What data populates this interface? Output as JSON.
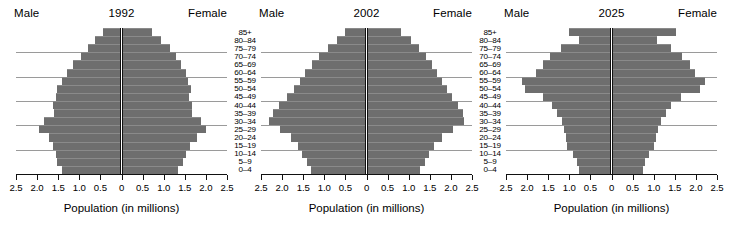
{
  "chart_data": {
    "type": "bar",
    "chart_kind": "population-pyramid",
    "title": "",
    "xlabel": "Population (in millions)",
    "ylabel": "",
    "xlim": [
      -2.5,
      2.5
    ],
    "xticks": [
      2.5,
      2.0,
      1.5,
      1.0,
      0.5,
      0,
      0.5,
      1.0,
      1.5,
      2.0,
      2.5
    ],
    "xticklabels": [
      "2.5",
      "2.0",
      "1.5",
      "1.0",
      "0.5",
      "0",
      "0.5",
      "1.0",
      "1.5",
      "2.0",
      "2.5"
    ],
    "grid": true,
    "grid_axis": "y",
    "legend": [
      "Male",
      "Female"
    ],
    "legend_position": "top-left-and-top-right",
    "bar_color": "#6e6e6e",
    "axis_color": "#111111",
    "gridline_color": "#9a9a9a",
    "categories": [
      "85+",
      "80–84",
      "75–79",
      "70–74",
      "65–69",
      "60–64",
      "55–59",
      "50–54",
      "45–49",
      "40–44",
      "35–39",
      "30–34",
      "25–29",
      "20–24",
      "15–19",
      "10–14",
      "5–9",
      "0–4"
    ],
    "panels": [
      {
        "year": "1992",
        "male_label": "Male",
        "female_label": "Female",
        "series": [
          {
            "name": "Male",
            "values": [
              0.45,
              0.62,
              0.8,
              0.97,
              1.15,
              1.3,
              1.42,
              1.52,
              1.55,
              1.63,
              1.6,
              1.83,
              1.95,
              1.73,
              1.62,
              1.56,
              1.52,
              1.4
            ]
          },
          {
            "name": "Female",
            "values": [
              0.72,
              0.93,
              1.15,
              1.28,
              1.42,
              1.52,
              1.58,
              1.65,
              1.6,
              1.68,
              1.66,
              1.88,
              2.0,
              1.78,
              1.62,
              1.53,
              1.46,
              1.34
            ]
          }
        ]
      },
      {
        "year": "2002",
        "male_label": "Male",
        "female_label": "Female",
        "series": [
          {
            "name": "Male",
            "values": [
              0.52,
              0.7,
              0.92,
              1.12,
              1.3,
              1.45,
              1.58,
              1.72,
              1.88,
              2.08,
              2.22,
              2.3,
              2.05,
              1.78,
              1.62,
              1.52,
              1.42,
              1.32
            ]
          },
          {
            "name": "Female",
            "values": [
              0.82,
              1.05,
              1.25,
              1.42,
              1.55,
              1.68,
              1.78,
              1.9,
              2.02,
              2.18,
              2.28,
              2.32,
              2.05,
              1.78,
              1.6,
              1.48,
              1.38,
              1.26
            ]
          }
        ]
      },
      {
        "year": "2025",
        "male_label": "Male",
        "female_label": "Female",
        "series": [
          {
            "name": "Male",
            "values": [
              1.0,
              0.78,
              1.2,
              1.45,
              1.62,
              1.78,
              2.12,
              2.05,
              1.62,
              1.42,
              1.28,
              1.18,
              1.12,
              1.08,
              1.05,
              0.92,
              0.82,
              0.78
            ]
          },
          {
            "name": "Female",
            "values": [
              1.52,
              1.08,
              1.42,
              1.68,
              1.85,
              1.98,
              2.22,
              2.1,
              1.65,
              1.42,
              1.28,
              1.18,
              1.1,
              1.05,
              1.0,
              0.9,
              0.8,
              0.75
            ]
          }
        ]
      }
    ]
  }
}
